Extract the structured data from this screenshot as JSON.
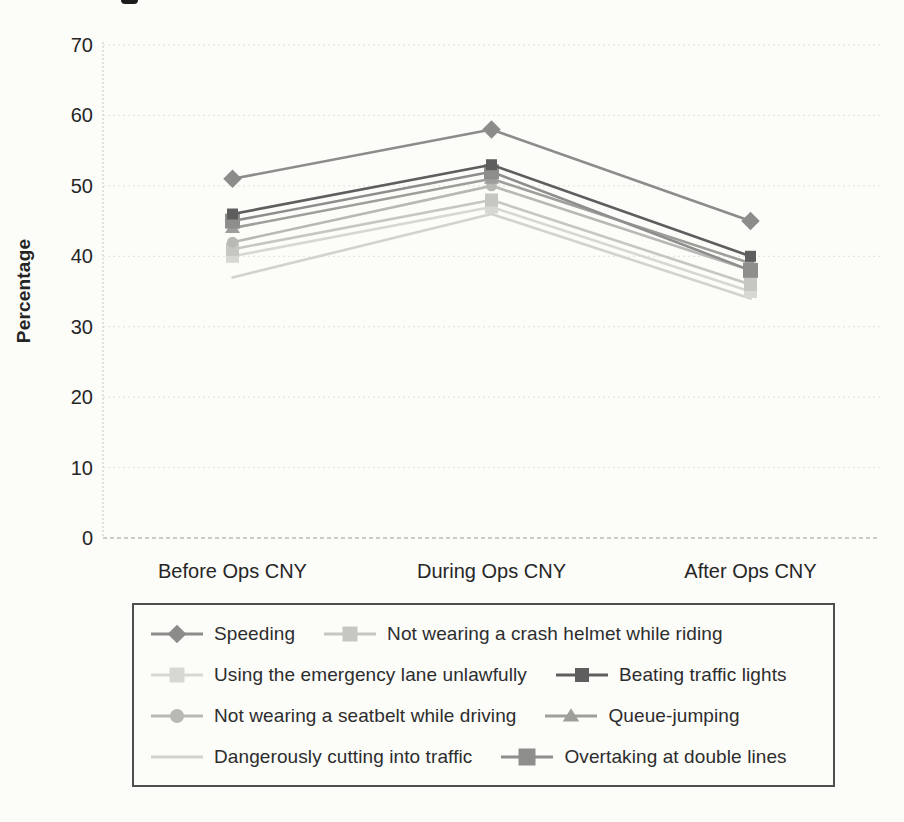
{
  "chart_data": {
    "type": "line",
    "title": "",
    "xlabel": "",
    "ylabel": "Percentage",
    "categories": [
      "Before Ops CNY",
      "During Ops CNY",
      "After Ops CNY"
    ],
    "ylim": [
      0,
      70
    ],
    "yticks": [
      0,
      10,
      20,
      30,
      40,
      50,
      60,
      70
    ],
    "grid": "horizontal-dashed",
    "legend_position": "bottom-boxed",
    "series": [
      {
        "name": "Speeding",
        "marker": "diamond",
        "color": "#8c8c8a",
        "marker_size": 16,
        "values": [
          51,
          58,
          45
        ]
      },
      {
        "name": "Not wearing a crash helmet while riding",
        "marker": "square",
        "color": "#c6c6c2",
        "marker_size": 13,
        "values": [
          41,
          48,
          36
        ]
      },
      {
        "name": "Using the emergency lane unlawfully",
        "marker": "square",
        "color": "#d8d8d3",
        "marker_size": 13,
        "values": [
          40,
          47,
          35
        ]
      },
      {
        "name": "Beating traffic lights",
        "marker": "square",
        "color": "#5e5e5e",
        "marker_size": 11,
        "values": [
          46,
          53,
          40
        ]
      },
      {
        "name": "Not wearing a seatbelt while driving",
        "marker": "circle",
        "color": "#b8b8b4",
        "marker_size": 11,
        "values": [
          42,
          50,
          38
        ]
      },
      {
        "name": "Queue-jumping",
        "marker": "triangle",
        "color": "#9e9e9a",
        "marker_size": 13,
        "values": [
          44,
          51,
          39
        ]
      },
      {
        "name": "Dangerously cutting into traffic",
        "marker": "none",
        "color": "#d2d2ce",
        "marker_size": 0,
        "values": [
          37,
          46,
          34
        ]
      },
      {
        "name": "Overtaking at double lines",
        "marker": "square",
        "color": "#8e8e8c",
        "marker_size": 15,
        "values": [
          45,
          52,
          38
        ]
      }
    ]
  }
}
